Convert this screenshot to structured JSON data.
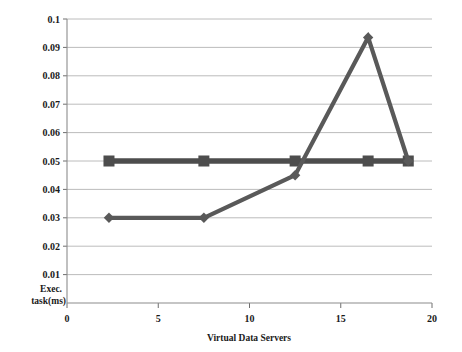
{
  "chart_data": {
    "type": "line",
    "title": "",
    "xlabel": "Virtual Data Servers",
    "ylabel": "Exec. task(ms)",
    "ylabel_lines": [
      "Exec.",
      "task(ms)"
    ],
    "xlim": [
      0,
      20
    ],
    "ylim": [
      0,
      0.1
    ],
    "grid": true,
    "legend": "none",
    "xticks": [
      0,
      5,
      10,
      15,
      20
    ],
    "xtick_labels": [
      "0",
      "5",
      "10",
      "15",
      "20"
    ],
    "yticks": [
      0.01,
      0.02,
      0.03,
      0.04,
      0.05,
      0.06,
      0.07,
      0.08,
      0.09,
      0.1
    ],
    "ytick_labels": [
      "0.01",
      "0.02",
      "0.03",
      "0.04",
      "0.05",
      "0.06",
      "0.07",
      "0.08",
      "0.09",
      "0.1"
    ],
    "series": [
      {
        "name": "series-squares",
        "marker": "square",
        "color": "#4d4d4d",
        "x": [
          2.3,
          7.5,
          12.5,
          16.5,
          18.7
        ],
        "values": [
          0.05,
          0.05,
          0.05,
          0.05,
          0.05
        ]
      },
      {
        "name": "series-diamonds",
        "marker": "diamond",
        "color": "#595959",
        "x": [
          2.3,
          7.5,
          12.5,
          16.5,
          18.7
        ],
        "values": [
          0.03,
          0.03,
          0.045,
          0.0935,
          0.05
        ]
      }
    ]
  },
  "colors": {
    "series_square": "#4d4d4d",
    "series_diamond": "#595959",
    "gridline": "#b4b4b4",
    "axis": "#8c8c8c",
    "text": "#1a1a1a",
    "background": "#ffffff"
  }
}
